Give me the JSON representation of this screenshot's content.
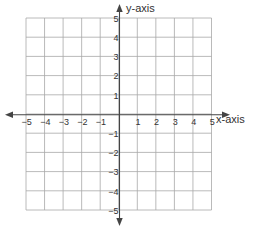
{
  "chart_data": {
    "type": "scatter",
    "title": "",
    "xlabel": "x-axis",
    "ylabel": "y-axis",
    "xlim": [
      -5,
      5
    ],
    "ylim": [
      -5,
      5
    ],
    "grid": true,
    "x_ticks": [
      "-5",
      "-4",
      "-3",
      "-2",
      "-1",
      "1",
      "2",
      "3",
      "4",
      "5"
    ],
    "y_ticks": [
      "5",
      "4",
      "3",
      "2",
      "1",
      "-1",
      "-2",
      "-3",
      "-4",
      "-5"
    ],
    "series": []
  },
  "colors": {
    "grid": "#a8a8a8",
    "axis": "#444444",
    "text": "#333333"
  }
}
